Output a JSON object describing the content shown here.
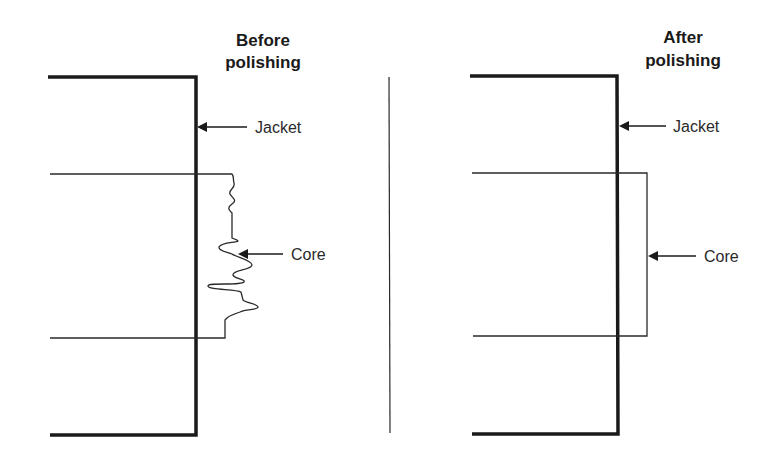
{
  "figure": {
    "left_panel": {
      "title_line1": "Before",
      "title_line2": "polishing",
      "jacket_label": "Jacket",
      "core_label": "Core"
    },
    "right_panel": {
      "title_line1": "After",
      "title_line2": "polishing",
      "jacket_label": "Jacket",
      "core_label": "Core"
    },
    "colors": {
      "line": "#1a1a1a",
      "background": "#ffffff"
    }
  }
}
